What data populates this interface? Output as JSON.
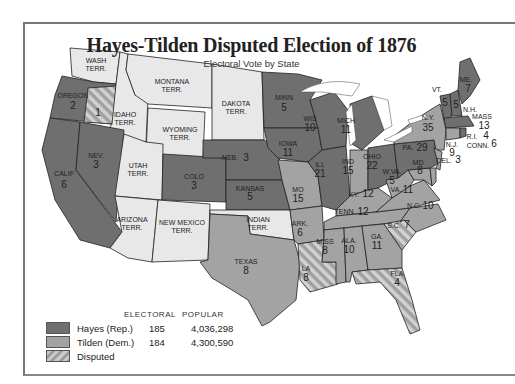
{
  "title": "Hayes-Tilden Disputed Election of 1876",
  "subtitle": "Electoral Vote by State",
  "colors": {
    "hayes": "#6f6f6f",
    "tilden": "#a3a3a3",
    "territory": "#e8e8e8",
    "disputed_light": "#cfcfcf",
    "disputed_dark": "#9c9c9c",
    "border": "#222222"
  },
  "legend": {
    "headers": {
      "electoral": "ELECTORAL",
      "popular": "POPULAR"
    },
    "entries": [
      {
        "label": "Hayes (Rep.)",
        "electoral": "185",
        "popular": "4,036,298",
        "swatch": "hayes"
      },
      {
        "label": "Tilden (Dem.)",
        "electoral": "184",
        "popular": "4,300,590",
        "swatch": "tilden"
      },
      {
        "label": "Disputed",
        "swatch": "disputed"
      }
    ]
  },
  "regions": {
    "wash": {
      "name": "WASH",
      "sub": "TERR.",
      "status": "territory"
    },
    "oregon": {
      "name": "OREGON",
      "votes": "2",
      "status": "hayes",
      "disputed_votes": "1"
    },
    "idaho": {
      "name": "IDAHO",
      "sub": "TERR.",
      "status": "territory"
    },
    "montana": {
      "name": "MONTANA",
      "sub": "TERR.",
      "status": "territory"
    },
    "dakota": {
      "name": "DAKOTA",
      "sub": "TERR.",
      "status": "territory"
    },
    "wyoming": {
      "name": "WYOMING",
      "sub": "TERR.",
      "status": "territory"
    },
    "utah": {
      "name": "UTAH",
      "sub": "TERR.",
      "status": "territory"
    },
    "arizona": {
      "name": "ARIZONA",
      "sub": "TERR.",
      "status": "territory"
    },
    "newmexico": {
      "name": "NEW MEXICO",
      "sub": "TERR.",
      "status": "territory"
    },
    "indian": {
      "name": "INDIAN",
      "sub": "TERR.",
      "status": "territory"
    },
    "calif": {
      "name": "CALIF",
      "votes": "6",
      "status": "hayes"
    },
    "nev": {
      "name": "NEV.",
      "votes": "3",
      "status": "hayes"
    },
    "colo": {
      "name": "COLO",
      "votes": "3",
      "status": "hayes"
    },
    "neb": {
      "name": "NEB.",
      "votes": "3",
      "status": "hayes"
    },
    "kansas": {
      "name": "KANSAS",
      "votes": "5",
      "status": "hayes"
    },
    "texas": {
      "name": "TEXAS",
      "votes": "8",
      "status": "tilden"
    },
    "minn": {
      "name": "MINN",
      "votes": "5",
      "status": "hayes"
    },
    "iowa": {
      "name": "IOWA",
      "votes": "11",
      "status": "hayes"
    },
    "mo": {
      "name": "MO",
      "votes": "15",
      "status": "tilden"
    },
    "ark": {
      "name": "ARK.",
      "votes": "6",
      "status": "tilden"
    },
    "la": {
      "name": "LA",
      "votes": "8",
      "status": "disputed"
    },
    "wis": {
      "name": "WIS",
      "votes": "10",
      "status": "hayes"
    },
    "ill": {
      "name": "ILL",
      "votes": "21",
      "status": "hayes"
    },
    "mich": {
      "name": "MICH",
      "votes": "11",
      "status": "hayes"
    },
    "ind": {
      "name": "IND",
      "votes": "15",
      "status": "tilden"
    },
    "ohio": {
      "name": "OHIO",
      "votes": "22",
      "status": "hayes"
    },
    "ky": {
      "name": "KY.",
      "votes": "12",
      "status": "tilden"
    },
    "tenn": {
      "name": "TENN.",
      "votes": "12",
      "status": "tilden"
    },
    "miss": {
      "name": "MISS",
      "votes": "8",
      "status": "tilden"
    },
    "ala": {
      "name": "ALA.",
      "votes": "10",
      "status": "tilden"
    },
    "ga": {
      "name": "GA.",
      "votes": "11",
      "status": "tilden"
    },
    "fla": {
      "name": "FLA",
      "votes": "4",
      "status": "disputed"
    },
    "sc": {
      "name": "S.C.",
      "votes": "7",
      "status": "disputed"
    },
    "nc": {
      "name": "N.C.",
      "votes": "10",
      "status": "tilden"
    },
    "va": {
      "name": "VA.",
      "votes": "11",
      "status": "tilden"
    },
    "wva": {
      "name": "W.VA.",
      "votes": "5",
      "status": "tilden"
    },
    "md": {
      "name": "MD",
      "votes": "8",
      "status": "tilden"
    },
    "del": {
      "name": "DEL.",
      "votes": "3",
      "status": "tilden"
    },
    "pa": {
      "name": "PA.",
      "votes": "29",
      "status": "hayes"
    },
    "ny": {
      "name": "N.Y.",
      "votes": "35",
      "status": "tilden"
    },
    "nj": {
      "name": "N.J.",
      "votes": "9",
      "status": "tilden"
    },
    "vt": {
      "name": "VT.",
      "votes": "5",
      "status": "hayes"
    },
    "nh": {
      "name": "N.H.",
      "votes": "5",
      "status": "hayes"
    },
    "me": {
      "name": "ME.",
      "votes": "7",
      "status": "hayes"
    },
    "mass": {
      "name": "MASS",
      "votes": "13",
      "status": "hayes"
    },
    "ri": {
      "name": "R.I.",
      "votes": "4",
      "status": "hayes"
    },
    "conn": {
      "name": "CONN.",
      "votes": "6",
      "status": "tilden"
    }
  }
}
